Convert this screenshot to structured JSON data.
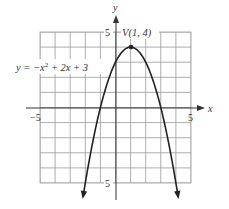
{
  "chart_data": {
    "type": "line",
    "title": "",
    "xlabel": "x",
    "ylabel": "y",
    "xlim": [
      -5,
      5
    ],
    "ylim": [
      -5,
      5
    ],
    "grid": true,
    "x_tick_labels": [
      "-5",
      "5"
    ],
    "y_tick_labels": [
      "5",
      "-5"
    ],
    "series": [
      {
        "name": "y = -x^2 + 2x + 3",
        "equation": "y = -x^2 + 2x + 3",
        "x": [
          -2.15,
          -2,
          -1.5,
          -1,
          -0.5,
          0,
          0.5,
          1,
          1.5,
          2,
          2.5,
          3,
          3.5,
          4,
          4.15
        ],
        "y": [
          -5.92,
          -5,
          -2.25,
          0,
          1.75,
          3,
          3.75,
          4,
          3.75,
          3,
          1.75,
          0,
          -2.25,
          -5,
          -5.92
        ]
      }
    ],
    "annotations": [
      {
        "text": "V(1, 4)",
        "x": 1,
        "y": 4,
        "type": "vertex"
      }
    ]
  },
  "labels": {
    "y_axis": "y",
    "x_axis": "x",
    "y_top_tick": "5",
    "y_bottom_tick": "5",
    "x_left_tick": "−5",
    "x_right_tick": "5",
    "vertex": "V(1, 4)",
    "equation_prefix": "y = −x",
    "equation_exp": "2",
    "equation_suffix": " + 2x + 3"
  }
}
